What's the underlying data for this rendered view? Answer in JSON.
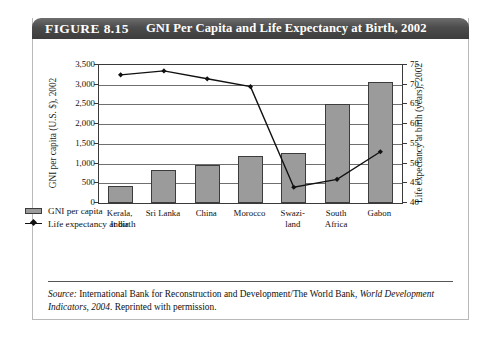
{
  "figure": {
    "label": "FIGURE 8.15",
    "title": "GNI Per Capita and Life Expectancy at Birth, 2002"
  },
  "source": {
    "prefix": "Source:",
    "text_main": " International Bank for Reconstruction and Development/The World Bank, ",
    "text_italic": "World Development Indicators, 2004",
    "text_tail": ". Reprinted with permission."
  },
  "legend": {
    "items": [
      {
        "label": "GNI per capita",
        "marker": "bar-swatch",
        "color": "#9b9b9b"
      },
      {
        "label": "Life expectancy at birth",
        "marker": "line-diamond-swatch",
        "color": "#111111"
      }
    ]
  },
  "chart_data": {
    "type": "bar",
    "title": "GNI Per Capita and Life Expectancy at Birth, 2002",
    "xlabel": "",
    "ylabel": "GNI per capita (U.S. $), 2002",
    "y2label": "Life expectancy at birth (years), 2002",
    "categories": [
      "Kerala, India",
      "Sri Lanka",
      "China",
      "Morocco",
      "Swazi-land",
      "South Africa",
      "Gabon"
    ],
    "category_lines": [
      [
        "Kerala,",
        "India"
      ],
      [
        "Sri Lanka"
      ],
      [
        "China"
      ],
      [
        "Morocco"
      ],
      [
        "Swazi-",
        "land"
      ],
      [
        "South",
        "Africa"
      ],
      [
        "Gabon"
      ]
    ],
    "series": [
      {
        "name": "GNI per capita",
        "type": "bar",
        "axis": "left",
        "units": "U.S. $",
        "color": "#9b9b9b",
        "values": [
          430,
          850,
          960,
          1190,
          1280,
          2500,
          3060
        ]
      },
      {
        "name": "Life expectancy at birth",
        "type": "line",
        "axis": "right",
        "units": "years",
        "color": "#111111",
        "marker": "diamond",
        "values": [
          72.5,
          73.5,
          71.5,
          69.5,
          44.0,
          46.0,
          53.0
        ]
      }
    ],
    "ylim": [
      0,
      3500
    ],
    "yticks": [
      0,
      500,
      1000,
      1500,
      2000,
      2500,
      3000,
      3500
    ],
    "ytick_labels": [
      "0",
      "500",
      "1,000",
      "1,500",
      "2,000",
      "2,500",
      "3,000",
      "3,500"
    ],
    "y2lim": [
      40,
      75
    ],
    "y2ticks": [
      40,
      45,
      50,
      55,
      60,
      65,
      70,
      75
    ],
    "y2tick_labels": [
      "40",
      "45",
      "50",
      "55",
      "60",
      "65",
      "70",
      "75"
    ],
    "grid": true,
    "legend_position": "below-left"
  }
}
